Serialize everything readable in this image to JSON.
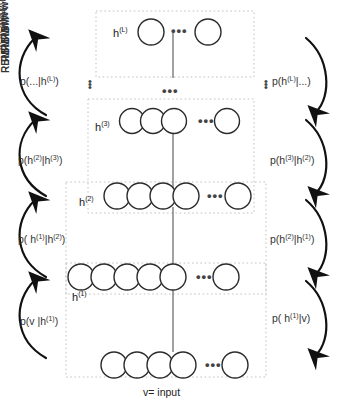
{
  "figure": {
    "background_color": "#ffffff",
    "stroke_color": "#2b2b2b",
    "dotted_box_color": "#bdbdbd"
  },
  "layers": [
    {
      "id": "hL",
      "label_html": "h(L)",
      "label": "h",
      "superscript": "(L)",
      "circles_before_dots": 1,
      "circles_after_dots": 1,
      "dots": "•••"
    },
    {
      "id": "h3",
      "label": "h",
      "superscript": "(3)",
      "circles_before_dots": 3,
      "circles_after_dots": 1,
      "dots": "•••"
    },
    {
      "id": "h2",
      "label": "h",
      "superscript": "(2)",
      "circles_before_dots": 4,
      "circles_after_dots": 1,
      "dots": "•••"
    },
    {
      "id": "h1",
      "label": "h",
      "superscript": "(1)",
      "circles_before_dots": 5,
      "circles_after_dots": 1,
      "dots": "•••"
    },
    {
      "id": "v",
      "label": "v",
      "superscript": "",
      "circles_before_dots": 4,
      "circles_after_dots": 1,
      "dots": "•••"
    }
  ],
  "weights": [
    {
      "id": "wL",
      "label": "W",
      "superscript": "(L)"
    },
    {
      "id": "w3",
      "label": "W",
      "superscript": "(3)"
    },
    {
      "id": "w2",
      "label": "W",
      "superscript": "(2)"
    },
    {
      "id": "w1",
      "label": "W",
      "superscript": "(1)"
    }
  ],
  "rbm_boxes": [
    {
      "id": "rbmL",
      "label": "RBM",
      "superscript": "(L)"
    },
    {
      "id": "rbm3",
      "label": "RBM",
      "superscript": "(3)"
    },
    {
      "id": "rbm2",
      "label": "RBM",
      "superscript": "(2)"
    },
    {
      "id": "rbm1",
      "label": "RBM",
      "superscript": "(1)"
    }
  ],
  "left_probabilities": [
    {
      "id": "p-top-left",
      "text": "p(...|h(L))",
      "base": "p(...|h",
      "sup": "(L)",
      "tail": ")"
    },
    {
      "id": "p-h2-given-h3",
      "base": "p(h",
      "sup1": "(2)",
      "mid": "|h",
      "sup2": "(3)",
      "tail": ")"
    },
    {
      "id": "p-h1-given-h2",
      "base": "p( h",
      "sup1": "(1)",
      "mid": "|h",
      "sup2": "(2)",
      "tail": ")"
    },
    {
      "id": "p-v-given-h1",
      "base": "p(v |h",
      "sup1": "(1)",
      "mid": "",
      "sup2": "",
      "tail": ")"
    }
  ],
  "right_probabilities": [
    {
      "id": "p-hL-given-dots",
      "base": "p(h",
      "sup1": "(L)",
      "mid": "|...",
      "sup2": "",
      "tail": ")"
    },
    {
      "id": "p-h3-given-h2",
      "base": "p(h",
      "sup1": "(3)",
      "mid": "|h",
      "sup2": "(2)",
      "tail": ")"
    },
    {
      "id": "p-h2-given-h1",
      "base": "p(h",
      "sup1": "(2)",
      "mid": "|h",
      "sup2": "(1)",
      "tail": ")"
    },
    {
      "id": "p-h1-given-v",
      "base": "p( h",
      "sup1": "(1)",
      "mid": "|v",
      "sup2": "",
      "tail": ")"
    }
  ],
  "ellipses": {
    "left_vertical": "⋮",
    "right_vertical": "⋮",
    "center_vertical": "•••",
    "center_middle": "•••"
  },
  "caption": {
    "text": "v= input"
  }
}
